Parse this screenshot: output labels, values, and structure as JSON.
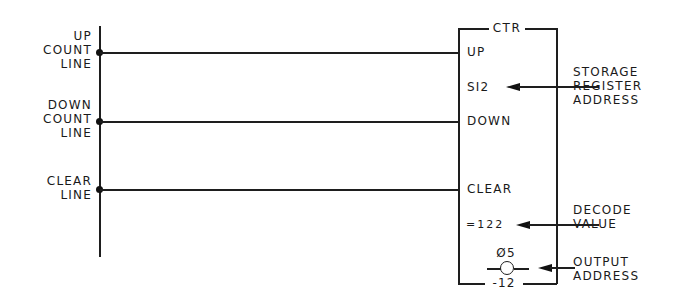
{
  "diagram": {
    "type": "ladder-logic counter instruction",
    "rail_labels": {
      "up_count": [
        "UP",
        "COUNT",
        "LINE"
      ],
      "down_count": [
        "DOWN",
        "COUNT",
        "LINE"
      ],
      "clear": [
        "CLEAR",
        "LINE"
      ]
    },
    "block": {
      "title": "CTR",
      "inputs": [
        "UP",
        "DOWN",
        "CLEAR"
      ],
      "storage_register": "SI2",
      "decode_value": "=122",
      "output_address_top": "Ø5",
      "output_address_bottom": "-12"
    },
    "callouts": {
      "storage_register_address": [
        "STORAGE",
        "REGISTER",
        "ADDRESS"
      ],
      "decode_value": [
        "DECODE",
        "VALUE"
      ],
      "output_address": [
        "OUTPUT",
        "ADDRESS"
      ]
    }
  }
}
